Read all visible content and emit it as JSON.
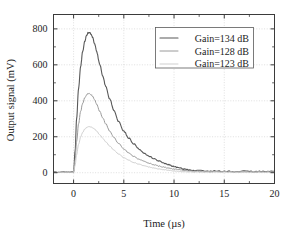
{
  "chart_data": {
    "type": "line",
    "title": "",
    "xlabel": "Time (µs)",
    "ylabel": "Output signal (mV)",
    "xlim": [
      -2,
      20
    ],
    "ylim": [
      -60,
      880
    ],
    "xticks": [
      0,
      5,
      10,
      15,
      20
    ],
    "xticklabels": [
      "0",
      "5",
      "10",
      "15",
      "20"
    ],
    "yticks": [
      0,
      200,
      400,
      600,
      800
    ],
    "yticklabels": [
      "0",
      "200",
      "400",
      "600",
      "800"
    ],
    "grid": true,
    "legend_position": "upper right",
    "series": [
      {
        "name": "Gain=134 dB",
        "color": "#585858",
        "linewidth": 1.1,
        "peak_value": 780,
        "peak_time": 1.6,
        "x": [
          -2.0,
          -1.5,
          -1.0,
          -0.5,
          -0.2,
          0.0,
          0.15,
          0.3,
          0.5,
          0.7,
          0.9,
          1.1,
          1.3,
          1.45,
          1.6,
          1.75,
          1.9,
          2.1,
          2.3,
          2.6,
          2.9,
          3.2,
          3.6,
          4.0,
          4.5,
          5.0,
          5.5,
          6.0,
          6.5,
          7.0,
          7.5,
          8.0,
          8.5,
          9.0,
          9.5,
          10.0,
          10.5,
          11.0,
          11.5,
          12.0,
          13.0,
          14.0,
          15.0,
          16.0,
          17.0,
          18.0,
          19.0,
          20.0
        ],
        "y": [
          4,
          2,
          5,
          3,
          4,
          6,
          120,
          300,
          470,
          590,
          672,
          730,
          765,
          778,
          780,
          770,
          752,
          716,
          672,
          604,
          540,
          480,
          410,
          348,
          283,
          232,
          192,
          160,
          133,
          111,
          93,
          78,
          65,
          54,
          44,
          35,
          27,
          20,
          15,
          12,
          10,
          9,
          8,
          7,
          8,
          7,
          6,
          7
        ]
      },
      {
        "name": "Gain=128 dB",
        "color": "#9a9a9a",
        "linewidth": 1.0,
        "peak_value": 440,
        "peak_time": 1.6,
        "x": [
          -2.0,
          -1.5,
          -1.0,
          -0.5,
          -0.2,
          0.0,
          0.15,
          0.3,
          0.5,
          0.7,
          0.9,
          1.1,
          1.3,
          1.45,
          1.6,
          1.75,
          1.9,
          2.1,
          2.3,
          2.6,
          2.9,
          3.2,
          3.6,
          4.0,
          4.5,
          5.0,
          5.5,
          6.0,
          6.5,
          7.0,
          7.5,
          8.0,
          8.5,
          9.0,
          9.5,
          10.0,
          10.5,
          11.0,
          11.5,
          12.0,
          13.0,
          14.0,
          15.0,
          16.0,
          17.0,
          18.0,
          19.0,
          20.0
        ],
        "y": [
          3,
          2,
          4,
          3,
          3,
          5,
          70,
          175,
          272,
          340,
          385,
          415,
          434,
          440,
          440,
          434,
          424,
          404,
          380,
          342,
          306,
          272,
          232,
          197,
          161,
          132,
          109,
          91,
          76,
          63,
          53,
          44,
          37,
          31,
          25,
          20,
          16,
          12,
          9,
          7,
          6,
          6,
          5,
          5,
          5,
          5,
          4,
          5
        ]
      },
      {
        "name": "Gain=123 dB",
        "color": "#cfcfcf",
        "linewidth": 1.0,
        "peak_value": 255,
        "peak_time": 1.7,
        "x": [
          -2.0,
          -1.5,
          -1.0,
          -0.5,
          -0.2,
          0.0,
          0.15,
          0.3,
          0.5,
          0.7,
          0.9,
          1.1,
          1.3,
          1.45,
          1.6,
          1.75,
          1.9,
          2.1,
          2.3,
          2.6,
          2.9,
          3.2,
          3.6,
          4.0,
          4.5,
          5.0,
          5.5,
          6.0,
          6.5,
          7.0,
          7.5,
          8.0,
          8.5,
          9.0,
          9.5,
          10.0,
          10.5,
          11.0,
          11.5,
          12.0,
          13.0,
          14.0,
          15.0,
          16.0,
          17.0,
          18.0,
          19.0,
          20.0
        ],
        "y": [
          2,
          2,
          3,
          2,
          2,
          4,
          40,
          100,
          158,
          198,
          224,
          242,
          252,
          255,
          255,
          254,
          250,
          242,
          231,
          212,
          192,
          172,
          148,
          126,
          103,
          84,
          69,
          57,
          47,
          39,
          32,
          26,
          21,
          17,
          13,
          10,
          8,
          6,
          5,
          4,
          4,
          3,
          3,
          3,
          3,
          3,
          3,
          3
        ]
      }
    ]
  },
  "legend": {
    "entries": [
      {
        "label": "Gain=134 dB"
      },
      {
        "label": "Gain=128 dB"
      },
      {
        "label": "Gain=123 dB"
      }
    ]
  },
  "axes": {
    "x_label": "Time (µs)",
    "y_label": "Output signal (mV)",
    "x_tick_labels": [
      "0",
      "5",
      "10",
      "15",
      "20"
    ],
    "y_tick_labels": [
      "0",
      "200",
      "400",
      "600",
      "800"
    ]
  },
  "colors": {
    "series_1": "#585858",
    "series_2": "#9a9a9a",
    "series_3": "#cfcfcf",
    "axis": "#3b3b3b",
    "grid": "#c9c9c9",
    "background": "#ffffff"
  }
}
